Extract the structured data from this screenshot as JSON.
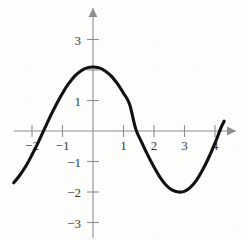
{
  "chart_data": {
    "type": "line",
    "title": "",
    "subtitle": "",
    "xlabel": "",
    "ylabel": "",
    "xlim": [
      -2.8,
      4.6
    ],
    "ylim": [
      -3.4,
      3.4
    ],
    "grid": false,
    "legend": null,
    "annotations": [],
    "x_ticks": [
      {
        "value": -2,
        "label": "−2"
      },
      {
        "value": -1,
        "label": "−1"
      },
      {
        "value": 1,
        "label": "1"
      },
      {
        "value": 2,
        "label": "2"
      },
      {
        "value": 3,
        "label": "3"
      },
      {
        "value": 4,
        "label": "4"
      }
    ],
    "y_ticks": [
      {
        "value": 3,
        "label": "3"
      },
      {
        "value": 2,
        "label": ""
      },
      {
        "value": 1,
        "label": "1"
      },
      {
        "value": -1,
        "label": "−1"
      },
      {
        "value": -2,
        "label": "−2"
      },
      {
        "value": -3,
        "label": "−3"
      }
    ],
    "series": [
      {
        "name": "curve",
        "color": "#111111",
        "x": [
          -2.6,
          -2.4,
          -2.2,
          -2.0,
          -1.8,
          -1.6,
          -1.4,
          -1.2,
          -1.0,
          -0.8,
          -0.6,
          -0.4,
          -0.2,
          0.0,
          0.2,
          0.4,
          0.6,
          0.8,
          1.0,
          1.2,
          1.4,
          1.6,
          1.8,
          2.0,
          2.2,
          2.4,
          2.6,
          2.8,
          3.0,
          3.2,
          3.4,
          3.6,
          3.8,
          4.0,
          4.2,
          4.3
        ],
        "y": [
          -1.7,
          -1.45,
          -1.15,
          -0.78,
          -0.38,
          0.05,
          0.48,
          0.88,
          1.24,
          1.55,
          1.8,
          1.97,
          2.07,
          2.1,
          2.07,
          1.97,
          1.8,
          1.55,
          1.24,
          0.88,
          0.07,
          -0.38,
          -0.8,
          -1.18,
          -1.52,
          -1.78,
          -1.94,
          -2.0,
          -1.98,
          -1.84,
          -1.6,
          -1.26,
          -0.86,
          -0.4,
          0.12,
          0.32
        ]
      }
    ],
    "key_points": {
      "maximum": {
        "x": 0,
        "y": 2.1
      },
      "minimum": {
        "x": 2.9,
        "y": -2.0
      },
      "zero_crossings": [
        -1.55,
        1.45
      ],
      "left_endpoint": {
        "x": -2.6,
        "y": -1.7
      },
      "right_endpoint": {
        "x": 4.3,
        "y": 0.32
      }
    },
    "axes_style": {
      "x_axis_arrow": "right",
      "y_axis_arrow": "up",
      "axis_color": "#8e8e8e",
      "curve_color": "#111111",
      "background": "#fdfdfc"
    }
  }
}
